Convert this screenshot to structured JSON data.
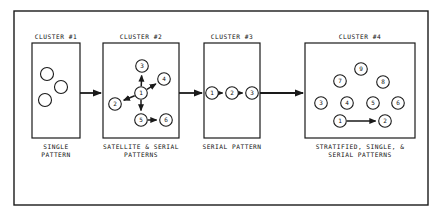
{
  "figure": {
    "name": "cluster-pattern-diagram",
    "frame": {
      "x": 14,
      "y": 11,
      "w": 414,
      "h": 194
    },
    "stroke_color": "#1a1a1a",
    "background_color": "#ffffff"
  },
  "clusters": [
    {
      "id": "cluster-1",
      "title": "CLUSTER #1",
      "caption": "SINGLE\nPATTERN",
      "box": {
        "x": 32,
        "y": 43,
        "w": 48,
        "h": 95
      },
      "title_center_x": 56,
      "caption_center_x": 56,
      "nodes": [
        {
          "label": "",
          "cx": 47,
          "cy": 74,
          "r": 6.5
        },
        {
          "label": "",
          "cx": 61,
          "cy": 87,
          "r": 6.5
        },
        {
          "label": "",
          "cx": 45,
          "cy": 100,
          "r": 6.5
        }
      ],
      "edges": []
    },
    {
      "id": "cluster-2",
      "title": "CLUSTER #2",
      "caption": "SATELLITE & SERIAL\nPATTERNS",
      "box": {
        "x": 103,
        "y": 43,
        "w": 76,
        "h": 95
      },
      "title_center_x": 141,
      "caption_center_x": 141,
      "nodes": [
        {
          "label": "1",
          "cx": 141,
          "cy": 93,
          "r": 6.3
        },
        {
          "label": "2",
          "cx": 115,
          "cy": 104,
          "r": 6.3
        },
        {
          "label": "3",
          "cx": 142,
          "cy": 66,
          "r": 6.3
        },
        {
          "label": "4",
          "cx": 164,
          "cy": 79,
          "r": 6.3
        },
        {
          "label": "5",
          "cx": 141,
          "cy": 120,
          "r": 6.3
        },
        {
          "label": "6",
          "cx": 166,
          "cy": 120,
          "r": 6.3
        }
      ],
      "edges": [
        {
          "from": "1",
          "to": "3"
        },
        {
          "from": "1",
          "to": "4"
        },
        {
          "from": "1",
          "to": "2"
        },
        {
          "from": "1",
          "to": "5"
        },
        {
          "from": "5",
          "to": "6"
        }
      ]
    },
    {
      "id": "cluster-3",
      "title": "CLUSTER #3",
      "caption": "SERIAL PATTERN",
      "box": {
        "x": 204,
        "y": 43,
        "w": 56,
        "h": 95
      },
      "title_center_x": 232,
      "caption_center_x": 232,
      "nodes": [
        {
          "label": "1",
          "cx": 212,
          "cy": 93,
          "r": 6.3
        },
        {
          "label": "2",
          "cx": 232,
          "cy": 93,
          "r": 6.3
        },
        {
          "label": "3",
          "cx": 252,
          "cy": 93,
          "r": 6.3
        }
      ],
      "edges": [
        {
          "from": "1",
          "to": "2"
        },
        {
          "from": "2",
          "to": "3"
        }
      ]
    },
    {
      "id": "cluster-4",
      "title": "CLUSTER #4",
      "caption": "STRATIFIED, SINGLE, &\nSERIAL PATTERNS",
      "box": {
        "x": 305,
        "y": 43,
        "w": 110,
        "h": 95
      },
      "title_center_x": 360,
      "caption_center_x": 360,
      "nodes": [
        {
          "label": "9",
          "cx": 361,
          "cy": 69,
          "r": 6.3
        },
        {
          "label": "7",
          "cx": 340,
          "cy": 81,
          "r": 6.3
        },
        {
          "label": "8",
          "cx": 383,
          "cy": 82,
          "r": 6.3
        },
        {
          "label": "3",
          "cx": 321,
          "cy": 103,
          "r": 6.3
        },
        {
          "label": "4",
          "cx": 347,
          "cy": 103,
          "r": 6.3
        },
        {
          "label": "5",
          "cx": 373,
          "cy": 103,
          "r": 6.3
        },
        {
          "label": "6",
          "cx": 398,
          "cy": 103,
          "r": 6.3
        },
        {
          "label": "1",
          "cx": 340,
          "cy": 121,
          "r": 6.3
        },
        {
          "label": "2",
          "cx": 385,
          "cy": 121,
          "r": 6.3
        }
      ],
      "edges": [
        {
          "from": "1",
          "to": "2"
        }
      ]
    }
  ],
  "connectors": [
    {
      "name": "connector-1-to-2",
      "x1": 80,
      "y1": 93,
      "x2": 101,
      "y2": 93
    },
    {
      "name": "connector-2-to-3",
      "x1": 179,
      "y1": 93,
      "x2": 202,
      "y2": 93
    },
    {
      "name": "connector-3-to-4",
      "x1": 260,
      "y1": 93,
      "x2": 303,
      "y2": 93
    }
  ]
}
